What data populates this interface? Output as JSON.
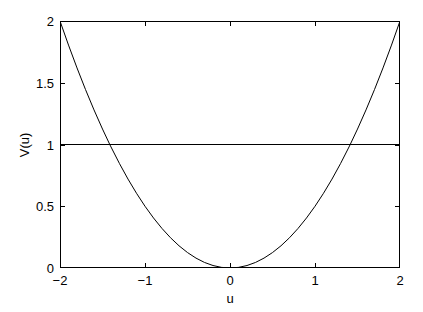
{
  "chart_data": {
    "type": "line",
    "title": "",
    "xlabel": "u",
    "ylabel": "V(u)",
    "xlim": [
      -2,
      2
    ],
    "ylim": [
      0,
      2
    ],
    "grid": false,
    "legend": null,
    "xticks": [
      -2,
      -1,
      0,
      1,
      2
    ],
    "xticklabels": [
      "−2",
      "−1",
      "0",
      "1",
      "2"
    ],
    "yticks": [
      0,
      0.5,
      1,
      1.5,
      2
    ],
    "yticklabels": [
      "0",
      "0.5",
      "1",
      "1.5",
      "2"
    ],
    "series": [
      {
        "name": "V(u) = u^2/2",
        "kind": "parabola",
        "color": "#000000",
        "linewidth": 1,
        "x": [
          -2,
          -1.9,
          -1.8,
          -1.7,
          -1.6,
          -1.5,
          -1.4142,
          -1.4,
          -1.3,
          -1.2,
          -1.1,
          -1,
          -0.9,
          -0.8,
          -0.7,
          -0.6,
          -0.5,
          -0.4,
          -0.3,
          -0.2,
          -0.1,
          0,
          0.1,
          0.2,
          0.3,
          0.4,
          0.5,
          0.6,
          0.7,
          0.8,
          0.9,
          1,
          1.1,
          1.2,
          1.3,
          1.4,
          1.4142,
          1.5,
          1.6,
          1.7,
          1.8,
          1.9,
          2
        ],
        "y": [
          2,
          1.805,
          1.62,
          1.445,
          1.28,
          1.125,
          1,
          0.98,
          0.845,
          0.72,
          0.605,
          0.5,
          0.405,
          0.32,
          0.245,
          0.18,
          0.125,
          0.08,
          0.045,
          0.02,
          0.005,
          0,
          0.005,
          0.02,
          0.045,
          0.08,
          0.125,
          0.18,
          0.245,
          0.32,
          0.405,
          0.5,
          0.605,
          0.72,
          0.845,
          0.98,
          1,
          1.125,
          1.28,
          1.445,
          1.62,
          1.805,
          2
        ]
      },
      {
        "name": "V = 1",
        "kind": "horizontal-line",
        "color": "#000000",
        "linewidth": 1,
        "x": [
          -2,
          2
        ],
        "y": [
          1,
          1
        ]
      }
    ],
    "annotations": [],
    "intersections": [
      {
        "x": -1.4142,
        "y": 1
      },
      {
        "x": 1.4142,
        "y": 1
      }
    ]
  },
  "axes": {
    "box_color": "#000000",
    "tick_direction": "in",
    "background": "#ffffff"
  }
}
